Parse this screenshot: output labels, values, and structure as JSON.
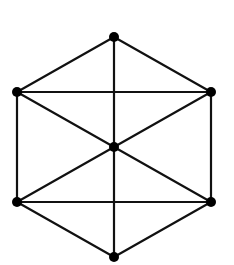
{
  "diagram": {
    "type": "graph",
    "colors": {
      "edge": "#111111",
      "node": "#000000",
      "background": "#ffffff"
    },
    "nodes": [
      {
        "id": "top",
        "x": 114,
        "y": 37
      },
      {
        "id": "upper-left",
        "x": 17,
        "y": 92
      },
      {
        "id": "upper-right",
        "x": 211,
        "y": 92
      },
      {
        "id": "center",
        "x": 114,
        "y": 147
      },
      {
        "id": "lower-left",
        "x": 17,
        "y": 202
      },
      {
        "id": "lower-right",
        "x": 211,
        "y": 202
      },
      {
        "id": "bottom",
        "x": 114,
        "y": 257
      }
    ],
    "edges": [
      [
        "top",
        "upper-left"
      ],
      [
        "top",
        "upper-right"
      ],
      [
        "top",
        "center"
      ],
      [
        "upper-left",
        "upper-right"
      ],
      [
        "upper-left",
        "lower-left"
      ],
      [
        "upper-left",
        "center"
      ],
      [
        "upper-right",
        "lower-right"
      ],
      [
        "upper-right",
        "center"
      ],
      [
        "center",
        "lower-left"
      ],
      [
        "center",
        "lower-right"
      ],
      [
        "center",
        "bottom"
      ],
      [
        "lower-left",
        "lower-right"
      ],
      [
        "lower-left",
        "bottom"
      ],
      [
        "lower-right",
        "bottom"
      ]
    ],
    "node_radius": 5
  }
}
